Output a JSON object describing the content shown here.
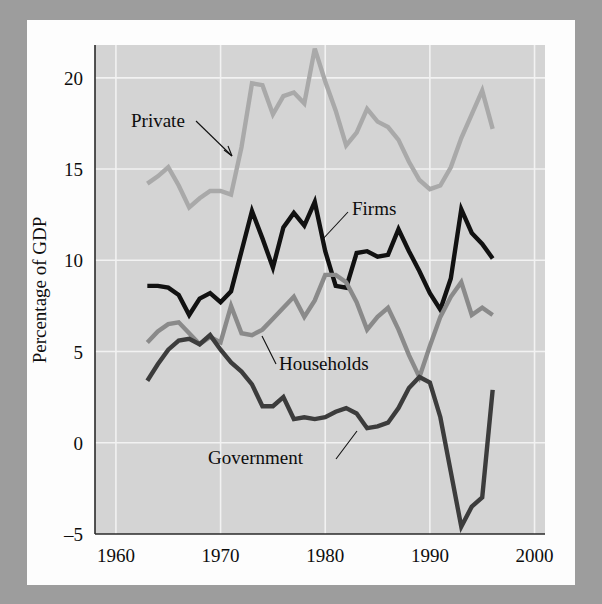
{
  "figure": {
    "background_color": "#9d9d9d",
    "paper_color": "#fdfdfd",
    "plot_background_color": "#d4d4d4",
    "gridline_color": "#f2f2f2",
    "axis_color": "#2a2a2a"
  },
  "axes": {
    "ylabel": "Percentage of GDP",
    "xlabel": "",
    "ytick_labels": [
      "20",
      "15",
      "10",
      "5",
      "0",
      "–5"
    ],
    "xtick_labels": [
      "1960",
      "1970",
      "1980",
      "1990",
      "2000"
    ]
  },
  "labels": {
    "private": "Private",
    "firms": "Firms",
    "households": "Households",
    "government": "Government"
  },
  "chart_data": {
    "type": "line",
    "title": "",
    "xlabel": "",
    "ylabel": "Percentage of GDP",
    "xlim": [
      1958,
      2001
    ],
    "ylim": [
      -5,
      21.8
    ],
    "xticks": [
      1960,
      1970,
      1980,
      1990,
      2000
    ],
    "yticks": [
      -5,
      0,
      5,
      10,
      15,
      20
    ],
    "grid": true,
    "legend": "inline-annotations",
    "x": [
      1963,
      1964,
      1965,
      1966,
      1967,
      1968,
      1969,
      1970,
      1971,
      1972,
      1973,
      1974,
      1975,
      1976,
      1977,
      1978,
      1979,
      1980,
      1981,
      1982,
      1983,
      1984,
      1985,
      1986,
      1987,
      1988,
      1989,
      1990,
      1991,
      1992,
      1993,
      1994,
      1995,
      1996
    ],
    "series": [
      {
        "name": "Private",
        "color": "#a9a9a9",
        "width": 4.4,
        "values": [
          14.2,
          14.6,
          15.1,
          14.1,
          12.9,
          13.4,
          13.8,
          13.8,
          13.6,
          16.2,
          19.7,
          19.6,
          18.0,
          19.0,
          19.2,
          18.6,
          21.6,
          19.8,
          18.2,
          16.3,
          17.0,
          18.3,
          17.6,
          17.3,
          16.6,
          15.4,
          14.4,
          13.9,
          14.1,
          15.1,
          16.7,
          18.0,
          19.3,
          17.2
        ]
      },
      {
        "name": "Firms",
        "color": "#111111",
        "width": 4.4,
        "values": [
          8.6,
          8.6,
          8.5,
          8.1,
          7.0,
          7.9,
          8.2,
          7.7,
          8.3,
          10.5,
          12.7,
          11.2,
          9.6,
          11.8,
          12.6,
          11.9,
          13.2,
          10.5,
          8.6,
          8.5,
          10.4,
          10.5,
          10.2,
          10.3,
          11.7,
          10.5,
          9.4,
          8.2,
          7.3,
          9.0,
          12.8,
          11.5,
          10.9,
          10.1
        ]
      },
      {
        "name": "Households",
        "color": "#8a8a8a",
        "width": 4.4,
        "values": [
          5.5,
          6.1,
          6.5,
          6.6,
          6.0,
          5.4,
          5.8,
          5.5,
          7.5,
          6.0,
          5.9,
          6.2,
          6.8,
          7.4,
          8.0,
          6.9,
          7.8,
          9.2,
          9.2,
          8.8,
          7.7,
          6.2,
          6.9,
          7.4,
          6.2,
          4.8,
          3.6,
          5.3,
          6.9,
          8.0,
          8.8,
          7.0,
          7.4,
          7.0
        ]
      },
      {
        "name": "Government",
        "color": "#3c3c3c",
        "width": 4.4,
        "values": [
          3.4,
          4.3,
          5.1,
          5.6,
          5.7,
          5.4,
          5.9,
          5.1,
          4.4,
          3.9,
          3.2,
          2.0,
          2.0,
          2.5,
          1.3,
          1.4,
          1.3,
          1.4,
          1.7,
          1.9,
          1.6,
          0.8,
          0.9,
          1.1,
          1.9,
          3.0,
          3.6,
          3.3,
          1.4,
          -1.6,
          -4.6,
          -3.5,
          -3.0,
          2.9
        ]
      }
    ],
    "annotations": [
      {
        "text": "Private",
        "x_text": 1965.0,
        "y_text": 17.8
      },
      {
        "text": "Firms",
        "x_text": 1981.4,
        "y_text": 13.0
      },
      {
        "text": "Households",
        "x_text": 1977.0,
        "y_text": 4.6
      },
      {
        "text": "Government",
        "x_text": 1973.0,
        "y_text": -1.2
      }
    ]
  }
}
